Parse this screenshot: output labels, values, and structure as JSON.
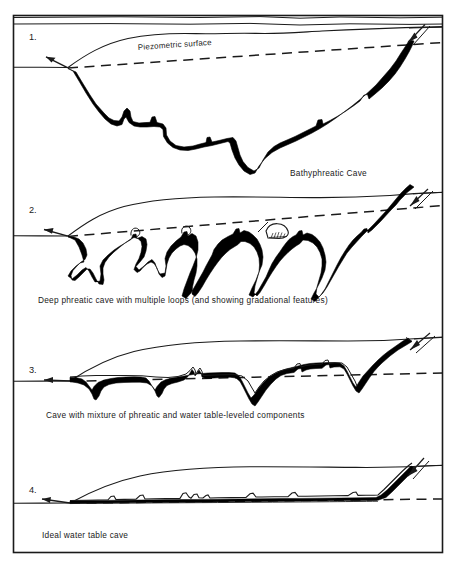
{
  "figure": {
    "background_color": "#ffffff",
    "ink_color": "#000000",
    "frame": {
      "x": 13,
      "y": 15,
      "width": 430,
      "height": 538,
      "stroke": "#1a1a1a"
    }
  },
  "panels": [
    {
      "number": "1.",
      "caption": "Bathyphreatic Cave",
      "caption_position": "right",
      "inline_labels": [
        {
          "name": "piezometric-surface-label",
          "text": "Piezometric surface"
        }
      ],
      "features": [
        "ground-surface-line",
        "piezometric-surface-dashed-line",
        "deep-looping-conduit",
        "sink-input-arrow",
        "spring-resurgence-arrow"
      ]
    },
    {
      "number": "2.",
      "caption": "Deep phreatic cave with multiple loops (and showing gradational features)",
      "caption_position": "left",
      "inline_labels": [],
      "features": [
        "ground-surface-line",
        "piezometric-surface-dashed-line",
        "multiple-loop-conduit",
        "sink-input-arrow",
        "spring-resurgence-arrow",
        "air-filled-chamber-detail"
      ]
    },
    {
      "number": "3.",
      "caption": "Cave with mixture of phreatic and water table-leveled components",
      "caption_position": "left",
      "inline_labels": [],
      "features": [
        "ground-surface-line",
        "water-table-dashed-line",
        "mixed-profile-conduit",
        "sink-input-arrow",
        "spring-resurgence-arrow"
      ]
    },
    {
      "number": "4.",
      "caption": "Ideal water table cave",
      "caption_position": "left",
      "inline_labels": [],
      "features": [
        "ground-surface-line",
        "water-table-dashed-line",
        "water-table-leveled-conduit",
        "sink-input-arrow",
        "spring-resurgence-arrow"
      ]
    }
  ],
  "legend_keys": {
    "solid_line": "ground surface / bedrock profile",
    "dashed_line": "piezometric surface / water table",
    "black_band": "cave conduit"
  }
}
